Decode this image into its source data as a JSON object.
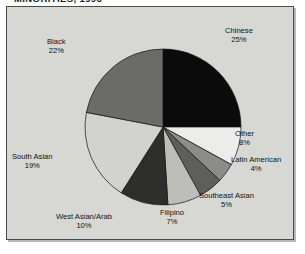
{
  "chart": {
    "title": "MINORITIES, 1996"
  },
  "chart_data": {
    "type": "pie",
    "title": "MINORITIES, 1996",
    "xlabel": "",
    "ylabel": "",
    "legend_position": "none",
    "grid": false,
    "units": "percent",
    "start_angle_deg": 0,
    "direction": "clockwise",
    "categories": [
      "Chinese",
      "Other",
      "Latin American",
      "Southeast Asian",
      "Filipino",
      "West Asian/Arab",
      "South Asian",
      "Black"
    ],
    "values": [
      25,
      8,
      4,
      5,
      7,
      10,
      19,
      22
    ],
    "slices": [
      {
        "label": "Chinese",
        "value": 25,
        "value_text": "25%",
        "color": "#0b0b0b",
        "label_x": 225,
        "label_y": 26
      },
      {
        "label": "Other",
        "value": 8,
        "value_text": "8%",
        "color": "#ececea",
        "label_x": 235,
        "label_y": 129
      },
      {
        "label": "Latin American",
        "value": 4,
        "value_text": "4%",
        "color": "#8c8c8a",
        "label_x": 231,
        "label_y": 155
      },
      {
        "label": "Southeast Asian",
        "value": 5,
        "value_text": "5%",
        "color": "#5e5e5c",
        "label_x": 199,
        "label_y": 191
      },
      {
        "label": "Filipino",
        "value": 7,
        "value_text": "7%",
        "color": "#bdbdba",
        "label_x": 160,
        "label_y": 208
      },
      {
        "label": "West Asian/Arab",
        "value": 10,
        "value_text": "10%",
        "color": "#2e2e2c",
        "label_x": 56,
        "label_y": 212
      },
      {
        "label": "South Asian",
        "value": 19,
        "value_text": "19%",
        "color": "#d2d2cf",
        "label_x": 12,
        "label_y": 152
      },
      {
        "label": "Black",
        "value": 22,
        "value_text": "22%",
        "color": "#6b6b69",
        "label_x": 47,
        "label_y": 37
      }
    ],
    "geometry": {
      "center_x": 163,
      "center_y": 127,
      "radius": 78
    },
    "colors": {
      "panel_background": "#d7d7d4",
      "page_background": "#ffffff",
      "frame": "#4a4a4a",
      "text": "#111111"
    }
  }
}
